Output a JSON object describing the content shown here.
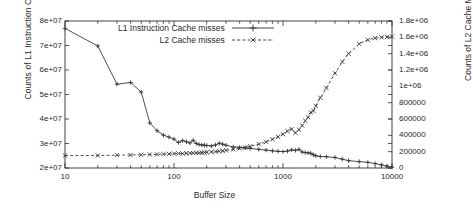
{
  "chart_data": {
    "type": "line",
    "title": "",
    "xlabel": "Buffer Size",
    "ylabel": "Counts of L1 Instruction Cache Misses",
    "y2label": "Counts of L2 Cache Misses",
    "xscale": "log",
    "xlim": [
      10,
      10000
    ],
    "ylim": [
      20000000,
      80000000
    ],
    "y2lim": [
      0,
      1800000
    ],
    "grid": false,
    "legend_position": "top-center",
    "xticks": [
      "10",
      "100",
      "1000",
      "10000"
    ],
    "xtick_values": [
      10,
      100,
      1000,
      10000
    ],
    "yticks": [
      "2e+07",
      "3e+07",
      "4e+07",
      "5e+07",
      "6e+07",
      "7e+07",
      "8e+07"
    ],
    "ytick_values": [
      20000000,
      30000000,
      40000000,
      50000000,
      60000000,
      70000000,
      80000000
    ],
    "y2ticks": [
      "0",
      "200000",
      "400000",
      "600000",
      "800000",
      "1e+06",
      "1.2e+06",
      "1.4e+06",
      "1.6e+06",
      "1.8e+06"
    ],
    "y2tick_values": [
      0,
      200000,
      400000,
      600000,
      800000,
      1000000,
      1200000,
      1400000,
      1600000,
      1800000
    ],
    "series": [
      {
        "name": "L1 Instruction Cache misses",
        "axis": "left",
        "marker": "plus",
        "dash": "solid",
        "color": "#303030",
        "x": [
          10,
          20,
          30,
          40,
          50,
          60,
          70,
          80,
          90,
          100,
          110,
          120,
          130,
          140,
          150,
          160,
          170,
          180,
          190,
          200,
          220,
          240,
          260,
          280,
          300,
          350,
          400,
          450,
          500,
          600,
          700,
          800,
          900,
          1000,
          1100,
          1200,
          1300,
          1400,
          1500,
          1600,
          1700,
          1800,
          1900,
          2000,
          2200,
          2500,
          3000,
          3500,
          4000,
          5000,
          6000,
          7000,
          8000,
          9000,
          10000
        ],
        "y": [
          77000000,
          69800000,
          54200000,
          54900000,
          51000000,
          38400000,
          35200000,
          33400000,
          32600000,
          31800000,
          30400000,
          31200000,
          30700000,
          30200000,
          31300000,
          30000000,
          29600000,
          29400000,
          29300000,
          29200000,
          29000000,
          29400000,
          30100000,
          29700000,
          29300000,
          28600000,
          28400000,
          28200000,
          28000000,
          27600000,
          27300000,
          27000000,
          26800000,
          26700000,
          26900000,
          27400000,
          27200000,
          27600000,
          26500000,
          26300000,
          26200000,
          26000000,
          25400000,
          25000000,
          24700000,
          24600000,
          24300000,
          23600000,
          23000000,
          22600000,
          22300000,
          21800000,
          21300000,
          20800000,
          20300000
        ]
      },
      {
        "name": "L2 Cache misses",
        "axis": "right",
        "marker": "cross",
        "dash": "dashed",
        "color": "#303030",
        "x": [
          10,
          20,
          30,
          40,
          50,
          60,
          70,
          80,
          90,
          100,
          110,
          120,
          130,
          140,
          150,
          160,
          170,
          180,
          190,
          200,
          220,
          240,
          260,
          280,
          300,
          350,
          400,
          450,
          500,
          600,
          700,
          800,
          900,
          1000,
          1100,
          1200,
          1300,
          1400,
          1500,
          1600,
          1700,
          1800,
          1900,
          2000,
          2200,
          2500,
          3000,
          3500,
          4000,
          5000,
          6000,
          7000,
          8000,
          9000,
          10000
        ],
        "y": [
          152000,
          153000,
          157000,
          160000,
          162000,
          165000,
          167000,
          170000,
          172000,
          176000,
          178000,
          176000,
          180000,
          181000,
          183000,
          184000,
          186000,
          188000,
          190000,
          192000,
          196000,
          200000,
          205000,
          210000,
          216000,
          228000,
          240000,
          252000,
          266000,
          292000,
          320000,
          352000,
          382000,
          414000,
          452000,
          476000,
          430000,
          470000,
          520000,
          580000,
          620000,
          680000,
          700000,
          760000,
          860000,
          980000,
          1160000,
          1300000,
          1400000,
          1520000,
          1570000,
          1590000,
          1600000,
          1605000,
          1610000
        ]
      }
    ]
  },
  "legend": {
    "items": [
      {
        "label": "L1 Instruction Cache misses"
      },
      {
        "label": "L2 Cache misses"
      }
    ]
  }
}
